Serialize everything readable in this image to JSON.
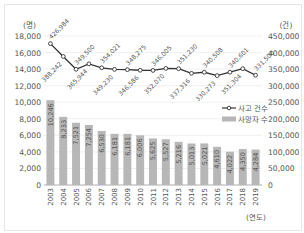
{
  "chart_data": {
    "type": "bar+line",
    "title": "",
    "xlabel": "(연도)",
    "categories": [
      "2003",
      "2004",
      "2005",
      "2006",
      "2007",
      "2008",
      "2009",
      "2010",
      "2011",
      "2012",
      "2013",
      "2014",
      "2015",
      "2016",
      "2017",
      "2018",
      "2019"
    ],
    "series": [
      {
        "name": "사망자 수",
        "type": "bar",
        "axis": "left",
        "unit": "(명)",
        "values": [
          10246,
          8233,
          7521,
          7254,
          6530,
          6181,
          6181,
          6006,
          5625,
          5527,
          5216,
          5013,
          5021,
          4610,
          4022,
          4350,
          4284
        ]
      },
      {
        "name": "사고 건수",
        "type": "line",
        "axis": "right",
        "unit": "(건)",
        "values": [
          426984,
          388242,
          349500,
          365944,
          354021,
          349230,
          348275,
          346586,
          346005,
          352070,
          351230,
          337316,
          340508,
          330273,
          340601,
          351304,
          331500
        ]
      }
    ],
    "left_axis": {
      "label": "(명)",
      "ticks": [
        "0",
        "2,000",
        "4,000",
        "6,000",
        "8,000",
        "10,000",
        "12,000",
        "14,000",
        "16,000",
        "18,000"
      ],
      "ylim": [
        0,
        18000
      ]
    },
    "right_axis": {
      "label": "(건)",
      "ticks": [
        "0",
        "50,000",
        "100,000",
        "150,000",
        "200,000",
        "250,000",
        "300,000",
        "350,000",
        "400,000",
        "450,000"
      ],
      "ylim": [
        0,
        450000
      ]
    },
    "legend": [
      {
        "label": "사고 건수",
        "symbol": "line-marker"
      },
      {
        "label": "사망자 수",
        "symbol": "bar"
      }
    ],
    "grid": true,
    "colors": {
      "bar": "#b7b7b7",
      "line": "#333333",
      "grid": "#e5e5e5"
    }
  }
}
